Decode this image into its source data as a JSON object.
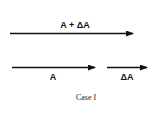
{
  "diagram": {
    "caption": "Case I",
    "vectors": [
      {
        "id": "sum",
        "label": "A + ΔA"
      },
      {
        "id": "a",
        "label": "A"
      },
      {
        "id": "delta",
        "label": "ΔA"
      }
    ],
    "colors": {
      "stroke": "#111111",
      "background": "#ffffff"
    }
  }
}
